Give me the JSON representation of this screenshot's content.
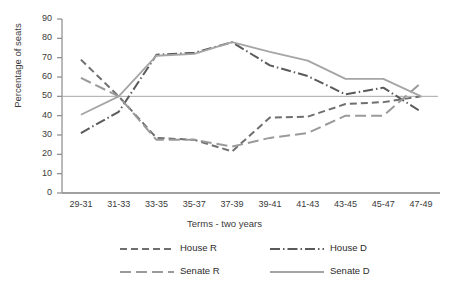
{
  "chart_data": {
    "type": "line",
    "title": "",
    "xlabel": "Terms - two years",
    "ylabel": "Percentage of seats",
    "categories": [
      "29-31",
      "31-33",
      "33-35",
      "35-37",
      "37-39",
      "39-41",
      "41-43",
      "43-45",
      "45-47",
      "47-49"
    ],
    "ylim": [
      0,
      90
    ],
    "yticks": [
      0,
      10,
      20,
      30,
      40,
      50,
      60,
      70,
      80,
      90
    ],
    "grid": false,
    "legend_position": "bottom",
    "reference_line": 50,
    "series": [
      {
        "name": "House R",
        "style": "dashed",
        "color": "#6f6f6f",
        "values": [
          69,
          50,
          28.5,
          27.5,
          21.5,
          39,
          39.5,
          46,
          47,
          50
        ]
      },
      {
        "name": "House D",
        "style": "dash-dot",
        "color": "#5a5a5a",
        "values": [
          31,
          42,
          71.5,
          72.5,
          78,
          66,
          60.5,
          51,
          54.5,
          42
        ]
      },
      {
        "name": "Senate R",
        "style": "long-dashed",
        "color": "#9a9a9a",
        "values": [
          59.5,
          50,
          27.5,
          27.5,
          24,
          28.5,
          31,
          40,
          40,
          57
        ]
      },
      {
        "name": "Senate D",
        "style": "solid",
        "color": "#a5a5a5",
        "values": [
          40.5,
          50,
          71,
          72,
          78,
          73,
          68.5,
          59,
          59,
          50
        ]
      }
    ]
  },
  "legend": {
    "items": [
      {
        "label": "House R"
      },
      {
        "label": "House D"
      },
      {
        "label": "Senate R"
      },
      {
        "label": "Senate D"
      }
    ]
  },
  "axes": {
    "y_title": "Percentage of seats",
    "x_title": "Terms - two years",
    "y_tick_labels": [
      "90",
      "80",
      "70",
      "60",
      "50",
      "40",
      "30",
      "20",
      "10",
      "0"
    ],
    "x_tick_labels": [
      "29-31",
      "31-33",
      "33-35",
      "35-37",
      "37-39",
      "39-41",
      "41-43",
      "43-45",
      "45-47",
      "47-49"
    ]
  }
}
